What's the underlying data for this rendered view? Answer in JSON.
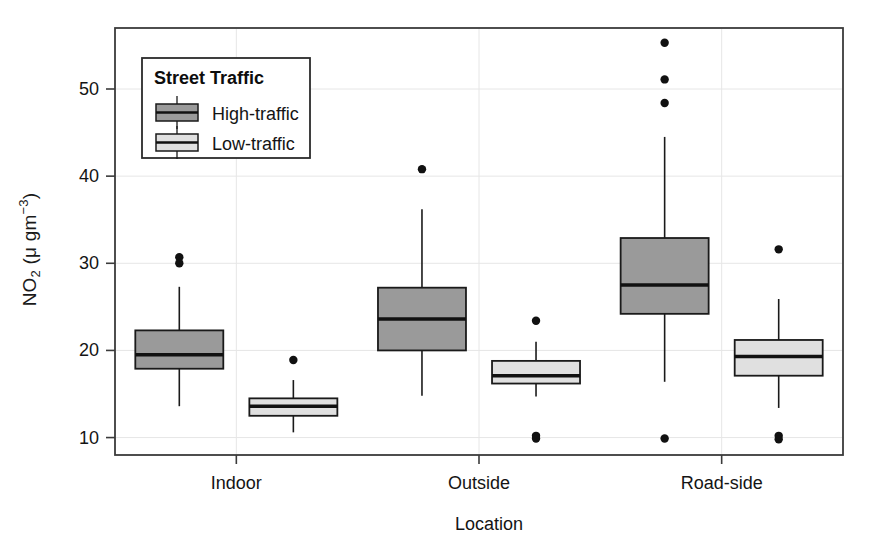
{
  "chart_data": {
    "type": "box",
    "title": "",
    "xlabel": "Location",
    "ylabel": "NO2 (μ gm-3)",
    "ylabel_parts": {
      "base": "NO",
      "sub": "2",
      "unit_open": " (",
      "mu": "μ",
      "unit": " gm",
      "sup": "−3",
      "unit_close": ")"
    },
    "categories": [
      "Indoor",
      "Outside",
      "Road-side"
    ],
    "ylim": [
      8.0,
      57.0
    ],
    "yticks": [
      10,
      20,
      30,
      40,
      50
    ],
    "ytick_labels": [
      "10",
      "20",
      "30",
      "40",
      "50"
    ],
    "grid": true,
    "grid_color": "#e6e6e6",
    "legend": {
      "title": "Street Traffic",
      "position": "top-left-inside",
      "entries": [
        {
          "label": "High-traffic",
          "color": "#9a9a9a"
        },
        {
          "label": "Low-traffic",
          "color": "#e0e0e0"
        }
      ]
    },
    "series": [
      {
        "name": "High-traffic",
        "color": "#9a9a9a",
        "boxes": [
          {
            "category": "Indoor",
            "min": 13.6,
            "q1": 17.9,
            "median": 19.5,
            "q3": 22.3,
            "max": 27.3,
            "outliers": [
              30.7,
              30.0
            ]
          },
          {
            "category": "Outside",
            "min": 14.8,
            "q1": 20.0,
            "median": 23.6,
            "q3": 27.2,
            "max": 36.2,
            "outliers": [
              40.8
            ]
          },
          {
            "category": "Road-side",
            "min": 16.4,
            "q1": 24.2,
            "median": 27.5,
            "q3": 32.9,
            "max": 44.5,
            "outliers": [
              55.3,
              51.1,
              48.4,
              9.9
            ]
          }
        ]
      },
      {
        "name": "Low-traffic",
        "color": "#e0e0e0",
        "boxes": [
          {
            "category": "Indoor",
            "min": 10.6,
            "q1": 12.5,
            "median": 13.6,
            "q3": 14.5,
            "max": 16.6,
            "outliers": [
              18.9
            ]
          },
          {
            "category": "Outside",
            "min": 14.7,
            "q1": 16.2,
            "median": 17.1,
            "q3": 18.8,
            "max": 21.0,
            "outliers": [
              23.4,
              10.2,
              9.9
            ]
          },
          {
            "category": "Road-side",
            "min": 13.4,
            "q1": 17.1,
            "median": 19.3,
            "q3": 21.2,
            "max": 25.9,
            "outliers": [
              31.6,
              10.2,
              9.8
            ]
          }
        ]
      }
    ]
  }
}
